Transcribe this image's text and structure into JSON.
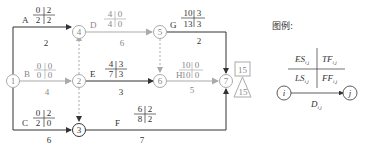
{
  "legend": {
    "title": "图例:",
    "es": "ES",
    "tf": "TF",
    "ls": "LS",
    "ff": "FF",
    "d": "D",
    "sub": "i,j",
    "node_i": "i",
    "node_j": "j"
  },
  "nodes": [
    {
      "id": "1",
      "label": "1"
    },
    {
      "id": "2",
      "label": "2"
    },
    {
      "id": "3",
      "label": "3"
    },
    {
      "id": "4",
      "label": "4"
    },
    {
      "id": "5",
      "label": "5"
    },
    {
      "id": "6",
      "label": "6"
    },
    {
      "id": "7",
      "label": "7"
    }
  ],
  "activities": {
    "A": {
      "name": "A",
      "es": "0",
      "tf": "2",
      "ls": "2",
      "ff": "2",
      "d": "2"
    },
    "B": {
      "name": "B",
      "es": "0",
      "tf": "0",
      "ls": "0",
      "ff": "0",
      "d": "4"
    },
    "C": {
      "name": "C",
      "es": "0",
      "tf": "2",
      "ls": "2",
      "ff": "0",
      "d": "6"
    },
    "D": {
      "name": "D",
      "es": "4",
      "tf": "0",
      "ls": "4",
      "ff": "0",
      "d": "6"
    },
    "E": {
      "name": "E",
      "es": "4",
      "tf": "3",
      "ls": "7",
      "ff": "3",
      "d": "3"
    },
    "F": {
      "name": "F",
      "es": "6",
      "tf": "2",
      "ls": "8",
      "ff": "2",
      "d": "7"
    },
    "G": {
      "name": "G",
      "es": "10",
      "tf": "3",
      "ls": "13",
      "ff": "3",
      "d": "2"
    },
    "H": {
      "name": "H",
      "es": "10",
      "tf": "0",
      "ls": "10",
      "ff": "0",
      "d": "5"
    }
  },
  "project": {
    "computed_duration": "15",
    "planned_duration": "15"
  },
  "colors": {
    "critical": "#aaaaaa",
    "normal": "#333333"
  }
}
